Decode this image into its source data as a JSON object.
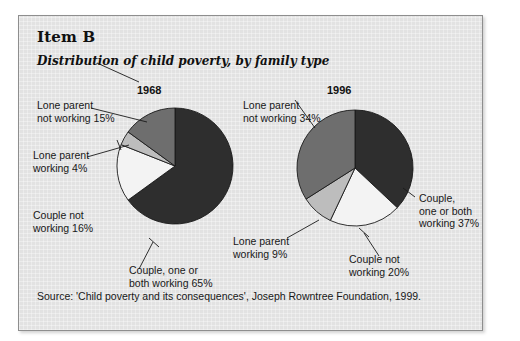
{
  "document": {
    "item_label": "Item B",
    "subtitle": "Distribution of child poverty, by family type",
    "source": "Source: 'Child poverty and its consequences', Joseph Rowntree Foundation, 1999."
  },
  "colors": {
    "page_background": "#ffffff",
    "panel_background": "#e2e2e2",
    "panel_border": "#8e8e8e",
    "slice_dark": "#2e2e2e",
    "slice_mid_gray": "#6e6e6e",
    "slice_light_gray": "#bdbdbd",
    "slice_white": "#f3f3f3",
    "outline": "#1a1a1a",
    "text": "#181818"
  },
  "chart_data": [
    {
      "type": "pie",
      "title": "1968",
      "categories": [
        "Couple, one or both working",
        "Couple not working",
        "Lone parent working",
        "Lone parent not working"
      ],
      "values": [
        65,
        16,
        4,
        15
      ],
      "labels": [
        "Couple, one or\nboth working 65%",
        "Couple not\nworking 16%",
        "Lone parent\nworking 4%",
        "Lone parent\nnot working 15%"
      ],
      "slice_colors": [
        "#2e2e2e",
        "#f3f3f3",
        "#bdbdbd",
        "#6e6e6e"
      ],
      "start_angle_deg": 0,
      "direction": "clockwise",
      "legend": "none",
      "grid": false
    },
    {
      "type": "pie",
      "title": "1996",
      "categories": [
        "Couple, one or both working",
        "Couple not working",
        "Lone parent working",
        "Lone parent not working"
      ],
      "values": [
        37,
        20,
        9,
        34
      ],
      "labels": [
        "Couple,\none or both\nworking 37%",
        "Couple not\nworking 20%",
        "Lone parent\nworking 9%",
        "Lone parent\nnot working 34%"
      ],
      "slice_colors": [
        "#2e2e2e",
        "#f3f3f3",
        "#bdbdbd",
        "#6e6e6e"
      ],
      "start_angle_deg": 0,
      "direction": "clockwise",
      "legend": "none",
      "grid": false
    }
  ],
  "labels_1968": {
    "lone_parent_not_working": "Lone parent\nnot working 15%",
    "lone_parent_working": "Lone parent\nworking 4%",
    "couple_not_working": "Couple not\nworking 16%",
    "couple_one_or_both_working": "Couple, one or\nboth working 65%"
  },
  "labels_1996": {
    "lone_parent_not_working": "Lone parent\nnot working 34%",
    "lone_parent_working": "Lone parent\nworking 9%",
    "couple_not_working": "Couple not\nworking 20%",
    "couple_one_or_both_working": "Couple,\none or both\nworking 37%"
  },
  "years": {
    "left": "1968",
    "right": "1996"
  }
}
